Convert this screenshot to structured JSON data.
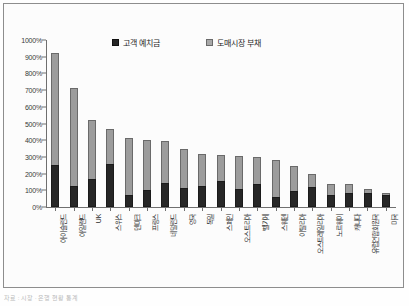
{
  "figure": {
    "caption": "자료 : 시장 · 은행 현황 통계"
  },
  "legend": {
    "position": "top-center",
    "items": [
      {
        "label": "고객 예치금",
        "color": "#262626",
        "swatch": "dark"
      },
      {
        "label": "도매시장 부채",
        "color": "#a8a8a8",
        "swatch": "light"
      }
    ]
  },
  "chart_data": {
    "type": "bar",
    "title": "",
    "subtitle": "",
    "xlabel": "",
    "ylabel": "",
    "stacked": true,
    "grid": false,
    "ylim": [
      0,
      1000
    ],
    "ytick_labels": [
      "1000%",
      "900%",
      "800%",
      "700%",
      "600%",
      "500%",
      "400%",
      "300%",
      "200%",
      "100%",
      "0%"
    ],
    "ytick_values": [
      1000,
      900,
      800,
      700,
      600,
      500,
      400,
      300,
      200,
      100,
      0
    ],
    "categories": [
      "아이슬란드",
      "아일랜드",
      "UK",
      "스위스",
      "덴마크",
      "프랑스",
      "네덜란드",
      "영국",
      "독일",
      "스페인",
      "오스트리아",
      "벨기에",
      "스웨덴",
      "이탈리아",
      "오스트레일리아",
      "노르웨이",
      "캐나다",
      "유럽연합회원국",
      "미국"
    ],
    "series": [
      {
        "name": "고객 예치금",
        "color": "#262626",
        "values": [
          250,
          125,
          165,
          260,
          70,
          100,
          145,
          115,
          125,
          155,
          110,
          135,
          60,
          95,
          120,
          70,
          85,
          85,
          70
        ]
      },
      {
        "name": "도매시장 부채",
        "color": "#a8a8a8",
        "values": [
          675,
          590,
          355,
          205,
          345,
          300,
          250,
          230,
          195,
          155,
          195,
          165,
          220,
          150,
          80,
          70,
          55,
          25,
          15
        ]
      }
    ],
    "totals": [
      925,
      715,
      520,
      465,
      415,
      400,
      395,
      345,
      320,
      310,
      305,
      300,
      280,
      245,
      200,
      140,
      140,
      110,
      85
    ]
  }
}
